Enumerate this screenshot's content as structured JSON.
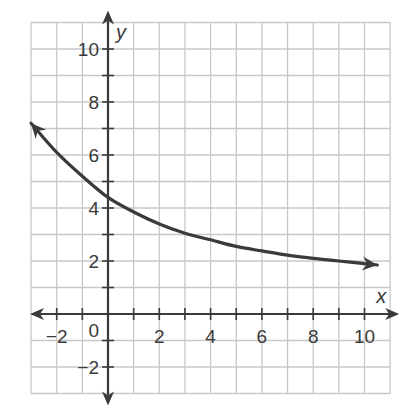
{
  "chart_data": {
    "type": "line",
    "title": "",
    "xlabel": "x",
    "ylabel": "y",
    "xlim": [
      -3,
      11
    ],
    "ylim": [
      -3,
      11
    ],
    "grid": true,
    "x_ticks": [
      -2,
      0,
      2,
      4,
      6,
      8,
      10
    ],
    "x_tick_labels": [
      "−2",
      "0",
      "2",
      "4",
      "6",
      "8",
      "10"
    ],
    "y_ticks": [
      -2,
      2,
      4,
      6,
      8,
      10
    ],
    "y_tick_labels": [
      "−2",
      "2",
      "4",
      "6",
      "8",
      "10"
    ],
    "series": [
      {
        "name": "curve",
        "x": [
          -3,
          -2,
          -1,
          0,
          1,
          2,
          3,
          4,
          5,
          6,
          7,
          8,
          9,
          10,
          10.5
        ],
        "values": [
          7.2,
          6.1,
          5.2,
          4.4,
          3.85,
          3.4,
          3.05,
          2.8,
          2.55,
          2.38,
          2.22,
          2.1,
          2.0,
          1.9,
          1.85
        ],
        "color": "#3a3a3a",
        "arrows": "both ends"
      }
    ],
    "legend": null
  },
  "axes": {
    "x_label": "x",
    "y_label": "y",
    "origin_label": "0"
  },
  "colors": {
    "grid": "#c8c8c8",
    "axis": "#3a3a3a",
    "curve": "#3a3a3a",
    "background": "#ffffff"
  }
}
